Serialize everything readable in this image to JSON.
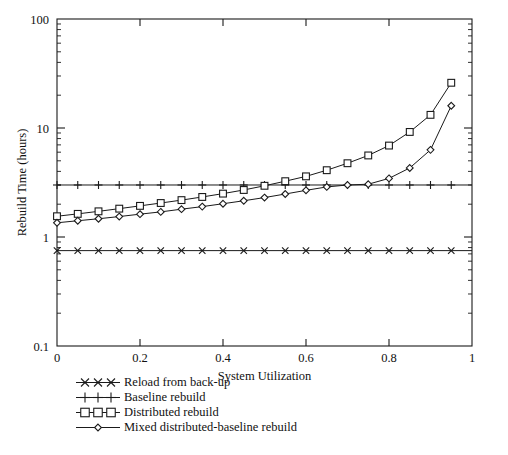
{
  "chart_data": {
    "type": "line",
    "title": "",
    "xlabel": "System Utilization",
    "ylabel": "Rebuild Time (hours)",
    "xlim": [
      0,
      1
    ],
    "ylim": [
      0.1,
      100
    ],
    "yscale": "log",
    "xscale": "linear",
    "grid": false,
    "legend_position": "below-left",
    "xticks": [
      0,
      0.2,
      0.4,
      0.6,
      0.8,
      1
    ],
    "xticklabels": [
      "0",
      "0.2",
      "0.4",
      "0.6",
      "0.8",
      "1"
    ],
    "yticks": [
      0.1,
      1,
      10,
      100
    ],
    "yticklabels": [
      "0.1",
      "1",
      "10",
      "100"
    ],
    "x": [
      0,
      0.05,
      0.1,
      0.15,
      0.2,
      0.25,
      0.3,
      0.35,
      0.4,
      0.45,
      0.5,
      0.55,
      0.6,
      0.65,
      0.7,
      0.75,
      0.8,
      0.85,
      0.9,
      0.95
    ],
    "series": [
      {
        "name": "Reload from back-up",
        "marker": "x",
        "values": [
          0.75,
          0.75,
          0.75,
          0.75,
          0.75,
          0.75,
          0.75,
          0.75,
          0.75,
          0.75,
          0.75,
          0.75,
          0.75,
          0.75,
          0.75,
          0.75,
          0.75,
          0.75,
          0.75,
          0.75
        ]
      },
      {
        "name": "Baseline rebuild",
        "marker": "plus",
        "values": [
          3.0,
          3.0,
          3.0,
          3.0,
          3.0,
          3.0,
          3.0,
          3.0,
          3.0,
          3.0,
          3.0,
          3.0,
          3.0,
          3.0,
          3.0,
          3.0,
          3.0,
          3.0,
          3.0,
          3.0
        ]
      },
      {
        "name": "Distributed rebuild",
        "marker": "square",
        "values": [
          1.55,
          1.63,
          1.72,
          1.82,
          1.93,
          2.05,
          2.18,
          2.33,
          2.5,
          2.7,
          2.95,
          3.25,
          3.6,
          4.1,
          4.75,
          5.6,
          6.9,
          9.2,
          13.2,
          26.0
        ]
      },
      {
        "name": "Mixed distributed-baseline rebuild",
        "marker": "diamond",
        "values": [
          1.35,
          1.41,
          1.47,
          1.54,
          1.62,
          1.7,
          1.8,
          1.9,
          2.02,
          2.15,
          2.3,
          2.48,
          2.68,
          2.88,
          3.0,
          3.05,
          3.45,
          4.3,
          6.3,
          16.0
        ]
      }
    ]
  },
  "legend": {
    "items": [
      {
        "label": "Reload from back-up",
        "marker": "x"
      },
      {
        "label": "Baseline rebuild",
        "marker": "plus"
      },
      {
        "label": "Distributed rebuild",
        "marker": "square"
      },
      {
        "label": "Mixed distributed-baseline rebuild",
        "marker": "diamond"
      }
    ]
  },
  "colors": {
    "line": "#1a1a1a",
    "axis": "#1a1a1a",
    "background": "#ffffff",
    "text": "#111111"
  }
}
